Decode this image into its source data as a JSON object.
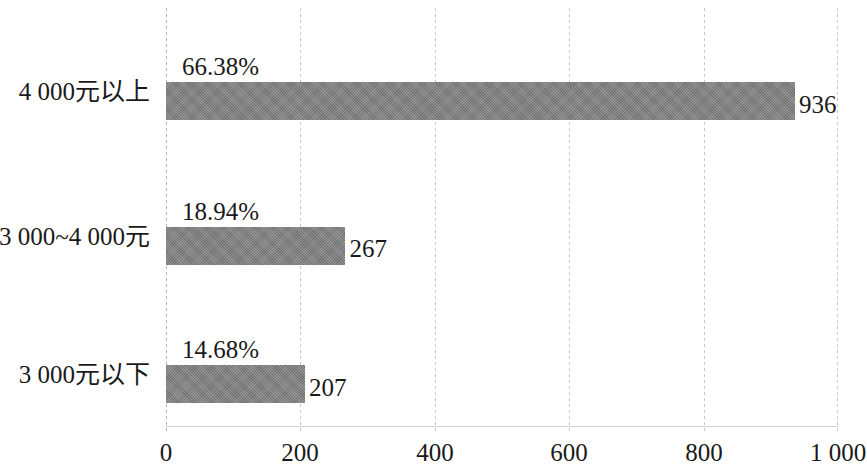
{
  "chart_data": {
    "type": "bar",
    "orientation": "horizontal",
    "title": "",
    "subtitle": "",
    "xlabel": "",
    "ylabel": "",
    "categories": [
      "4 000元以上",
      "3 000~4 000元",
      "3 000元以下"
    ],
    "values": [
      936,
      267,
      207
    ],
    "value_labels": [
      "936",
      "267",
      "207"
    ],
    "percent_labels": [
      "66.38%",
      "18.94%",
      "14.68%"
    ],
    "percents": [
      66.38,
      18.94,
      14.68
    ],
    "xlim": [
      0,
      1000
    ],
    "xticks": [
      0,
      200,
      400,
      600,
      800,
      1000
    ],
    "xtick_labels": [
      "0",
      "200",
      "400",
      "600",
      "800",
      "1 000"
    ],
    "grid": "vertical-dashed",
    "legend": null,
    "bar_color": "#808080",
    "text_color": "#1a1a1a",
    "grid_color": "#c8c8c8",
    "background_color": "#ffffff"
  }
}
